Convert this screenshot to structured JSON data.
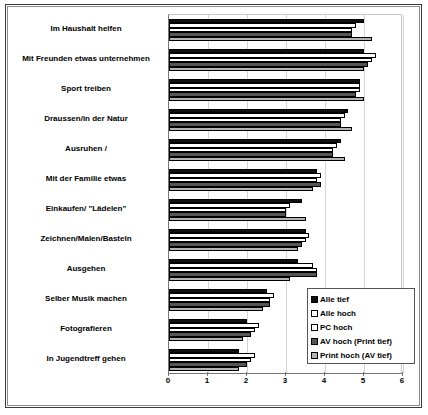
{
  "chart_data": {
    "type": "bar",
    "orientation": "horizontal",
    "title": "",
    "xlabel": "",
    "ylabel": "",
    "xlim": [
      0,
      6
    ],
    "xticks": [
      0,
      1,
      2,
      3,
      4,
      5,
      6
    ],
    "xtick_labels": [
      "0",
      "1",
      "2",
      "3",
      "4",
      "5",
      "6"
    ],
    "grid": true,
    "legend_position": "lower-right",
    "categories": [
      "Im Haushalt helfen",
      "Mit Freunden etwas unternehmen",
      "Sport treiben",
      "Draussen/in der Natur",
      "Ausruhen /",
      "Mit der Familie etwas",
      "Einkaufen/ \"Lädelen\"",
      "Zeichnen/Malen/Basteln",
      "Ausgehen",
      "Selber Musik machen",
      "Fotografieren",
      "In Jugendtreff gehen"
    ],
    "series": [
      {
        "name": "Alle tief",
        "color": "#101010",
        "swatch": "black",
        "values": [
          5.0,
          5.0,
          4.9,
          4.6,
          4.4,
          3.8,
          3.4,
          3.5,
          3.3,
          2.5,
          2.0,
          1.8
        ]
      },
      {
        "name": "Alle hoch",
        "color": "#ffffff",
        "swatch": "white",
        "values": [
          4.8,
          5.3,
          4.9,
          4.5,
          4.3,
          3.9,
          3.1,
          3.6,
          3.7,
          2.7,
          2.3,
          2.2
        ]
      },
      {
        "name": "PC hoch",
        "color": "#ffffff",
        "swatch": "white",
        "values": [
          4.7,
          5.2,
          4.9,
          4.4,
          4.2,
          3.8,
          3.0,
          3.5,
          3.8,
          2.6,
          2.2,
          2.1
        ]
      },
      {
        "name": "AV hoch (Print tief)",
        "color": "#565656",
        "swatch": "dark-gray",
        "values": [
          4.7,
          5.1,
          4.8,
          4.4,
          4.2,
          3.9,
          3.0,
          3.4,
          3.8,
          2.6,
          2.1,
          2.0
        ]
      },
      {
        "name": "Print hoch (AV tief)",
        "color": "#b4b4b4",
        "swatch": "light-gray",
        "values": [
          5.2,
          5.0,
          5.0,
          4.7,
          4.5,
          3.7,
          3.5,
          3.3,
          3.1,
          2.4,
          1.9,
          1.8
        ]
      }
    ]
  }
}
